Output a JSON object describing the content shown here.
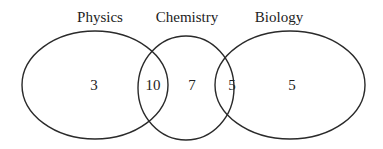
{
  "diagram": {
    "type": "venn",
    "sets": [
      {
        "id": "physics",
        "label": "Physics"
      },
      {
        "id": "chemistry",
        "label": "Chemistry"
      },
      {
        "id": "biology",
        "label": "Biology"
      }
    ],
    "regions": {
      "physics_only": "3",
      "physics_chemistry": "10",
      "chemistry_only": "7",
      "chemistry_biology": "5",
      "biology_only": "5"
    }
  }
}
